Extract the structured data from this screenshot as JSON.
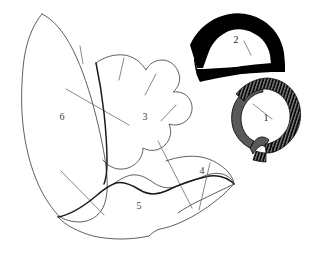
{
  "figure": {
    "background_color": "#ffffff",
    "width": 313,
    "height": 254,
    "colors": {
      "outline_stroke": "#4d4d4d",
      "dark_outline_stroke": "#1a1a1a",
      "break_line_stroke": "#6b6b6b",
      "solid_fill": "#000000",
      "gray_fill": "#595959",
      "label_color": "#1a1a1a"
    }
  },
  "fragments": [
    {
      "id": "fragment-1",
      "label": "1",
      "label_x": 266,
      "label_y": 119,
      "style": "hatched-arc",
      "description": "small curved arc segment with hatched black outer band and gray inner band"
    },
    {
      "id": "fragment-2",
      "label": "2",
      "label_x": 236,
      "label_y": 41,
      "style": "solid-black-arc",
      "description": "thick solid black arched ring with white interior"
    },
    {
      "id": "fragment-3",
      "label": "3",
      "label_x": 145,
      "label_y": 118,
      "style": "outline",
      "description": "scalloped central leaf-shaped outline"
    },
    {
      "id": "fragment-4",
      "label": "4",
      "label_x": 202,
      "label_y": 172,
      "style": "outline",
      "description": "small wedge outline at right of lower lobe"
    },
    {
      "id": "fragment-5",
      "label": "5",
      "label_x": 139,
      "label_y": 207,
      "style": "outline",
      "description": "broad lower lobe outline"
    },
    {
      "id": "fragment-6",
      "label": "6",
      "label_x": 62,
      "label_y": 118,
      "style": "outline",
      "description": "tall left leaf-shaped outline"
    }
  ],
  "shapes": {
    "fragment6_outline": "M 41 13 C 31 26 26 44 24 66 C 22 90 22 110 24 131 C 26 152 31 172 39 191 C 45 206 52 214 56 218 C 58 220 56 214 59 210",
    "fragment6_left": "M 41 13 C 52 18 62 30 70 47 C 79 66 86 90 92 114 C 98 138 103 160 104 178 C 105 192 103 203 99 210 C 95 217 88 221 80 222 C 72 223 64 221 59 218",
    "fragment3_outline": "M 96 62 C 106 57 118 56 128 59 C 136 61 143 67 148 74 C 151 70 155 67 160 66 C 168 65 175 69 178 76 C 181 82 180 89 177 94 C 182 93 188 95 191 100 C 195 106 194 114 189 119 C 185 123 179 124 174 122 C 176 128 175 136 170 141 C 164 147 155 148 148 144 C 147 152 142 159 134 162 C 126 165 117 163 111 157",
    "fragment5_outline": "M 58 218 C 66 226 78 232 92 235 C 110 239 130 239 148 235 C 152 233 156 231 160 229 C 170 226 182 221 194 214 C 206 207 216 200 223 193 C 228 188 232 185 234 183",
    "fragment5_top": "M 58 216 C 72 214 86 203 98 192 C 108 183 117 176 126 174 C 134 173 141 177 148 182 C 154 186 161 188 168 186 C 178 183 190 178 202 174 C 212 171 222 172 230 177 C 233 179 234 181 234 183",
    "fragment4_outline": "M 167 171 C 177 166 189 163 200 163 C 211 163 221 167 229 173 C 232 176 234 180 234 183",
    "fragment4_bottom": "M 234 183 C 225 187 213 192 200 197 C 190 201 180 205 172 209",
    "fragment5_notch": "M 148 235 C 152 230 156 227 160 226 C 164 225 168 226 172 228"
  },
  "break_lines": [
    {
      "name": "break-6a",
      "d": "M 79 46 L 82 63"
    },
    {
      "name": "break-6b",
      "d": "M 66 88 L 128 124"
    },
    {
      "name": "break-6c",
      "d": "M 61 170 L 103 214"
    },
    {
      "name": "break-3a",
      "d": "M 126 60 L 121 80"
    },
    {
      "name": "break-3b",
      "d": "M 155 78 L 145 97"
    },
    {
      "name": "break-3c",
      "d": "M 175 109 L 162 122"
    },
    {
      "name": "break-3d",
      "d": "M 160 143 L 192 207"
    },
    {
      "name": "break-4a",
      "d": "M 210 164 L 198 209"
    },
    {
      "name": "break-1a",
      "d": "M 254 103 L 272 118"
    },
    {
      "name": "break-2a",
      "d": "M 245 41 L 251 54"
    }
  ]
}
